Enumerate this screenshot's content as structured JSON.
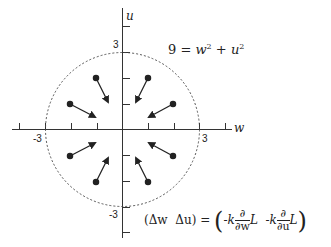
{
  "diagram": {
    "title": "",
    "axes": {
      "x_label": "w",
      "y_label": "u",
      "x_tick_labels": [
        "-3",
        "3"
      ],
      "y_tick_labels": [
        "3",
        "-3"
      ]
    },
    "circle_equation": {
      "lhs": "9",
      "eq": "=",
      "t1": "w",
      "t1_exp": "2",
      "plus": "+",
      "t2": "u",
      "t2_exp": "2"
    },
    "update_rule": {
      "lhs_open": "(",
      "dw": "Δw",
      "du": "Δu",
      "lhs_close": ")",
      "eq": "=",
      "open": "(",
      "neg_k1": "-k",
      "partial": "∂",
      "dvar1": "∂w",
      "L1": "L",
      "neg_k2": "-k",
      "dvar2": "∂u",
      "L2": "L",
      "close": ")"
    },
    "arrows_count": 8
  }
}
